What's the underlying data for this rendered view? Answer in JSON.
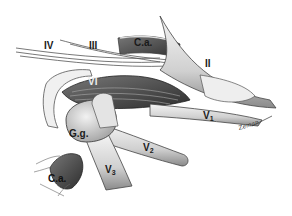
{
  "figure": {
    "type": "anatomical illustration",
    "style": "grayscale pencil drawing",
    "labels": {
      "iv": "IV",
      "iii": "III",
      "ca_top": "C.a.",
      "ii": "II",
      "vi": "VI",
      "v1_base": "V",
      "v1_sub": "1",
      "gg": "G.g.",
      "v2_base": "V",
      "v2_sub": "2",
      "ca_bottom": "C.a.",
      "v3_base": "V",
      "v3_sub": "3"
    },
    "signature": "Zeman"
  },
  "colors": {
    "background": "#ffffff",
    "ink": "#1a1a1a",
    "shade_dark": "#4a4a4a",
    "shade_mid": "#9a9a9a",
    "shade_light": "#d8d8d8"
  }
}
